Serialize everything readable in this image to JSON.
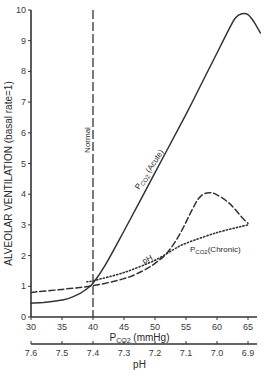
{
  "chart_data": {
    "type": "line",
    "title": "",
    "xlabel": "P CO₂ (mmHg)",
    "xlabel_main": "P",
    "xlabel_sub": "CO2",
    "xlabel_unit": "(mmHg)",
    "ylabel": "ALVEOLAR   VENTILATION   (basal rate=1)",
    "xlim": [
      30,
      67
    ],
    "ylim": [
      0,
      10
    ],
    "grid": false,
    "x_ticks": [
      30,
      35,
      40,
      45,
      50,
      55,
      60,
      65
    ],
    "x_tick_labels": [
      "30",
      "35",
      "40",
      "45",
      "50",
      "55",
      "60",
      "65"
    ],
    "y_ticks": [
      0,
      1,
      2,
      3,
      4,
      5,
      6,
      7,
      8,
      9,
      10
    ],
    "y_tick_labels": [
      "0",
      "1",
      "2",
      "3",
      "4",
      "5",
      "6",
      "7",
      "8",
      "9",
      "10"
    ],
    "secondary_x_axis": {
      "label": "pH",
      "ticks_at_pco2": [
        30,
        35,
        40,
        45,
        50,
        55,
        60,
        65
      ],
      "tick_labels": [
        "7.6",
        "7.5",
        "7.4",
        "7.3",
        "7.2",
        "7.1",
        "7.0",
        "6.9"
      ]
    },
    "reference_line": {
      "x": 40,
      "label": "Normal",
      "style": "dashed"
    },
    "series": [
      {
        "name": "PCO2 (Acute)",
        "label_main": "P",
        "label_sub": "CO2",
        "label_rest": " (Acute)",
        "style": "solid",
        "x": [
          30,
          32,
          34,
          36,
          38,
          39,
          40,
          42,
          45,
          50,
          55,
          58,
          60,
          62,
          63,
          64,
          65,
          66,
          67
        ],
        "y": [
          0.45,
          0.47,
          0.52,
          0.6,
          0.78,
          0.92,
          1.1,
          1.7,
          2.8,
          4.7,
          6.6,
          7.8,
          8.6,
          9.4,
          9.75,
          9.88,
          9.85,
          9.6,
          9.25
        ]
      },
      {
        "name": "pH",
        "label": "pH",
        "style": "dashed",
        "x": [
          30,
          35,
          40,
          45,
          48,
          50,
          52,
          54,
          56,
          57,
          58,
          59,
          60,
          62,
          64,
          65
        ],
        "y": [
          0.8,
          0.9,
          1.02,
          1.25,
          1.5,
          1.75,
          2.1,
          2.7,
          3.5,
          3.85,
          4.02,
          4.05,
          3.98,
          3.7,
          3.25,
          3.05
        ]
      },
      {
        "name": "PCO2 (Chronic)",
        "label_main": "P",
        "label_sub": "CO2",
        "label_rest": "(Chronic)",
        "style": "dotted",
        "x": [
          39,
          40,
          45,
          50,
          53,
          55,
          60,
          65
        ],
        "y": [
          1.15,
          1.18,
          1.45,
          1.85,
          2.2,
          2.4,
          2.75,
          3.0
        ]
      }
    ]
  }
}
